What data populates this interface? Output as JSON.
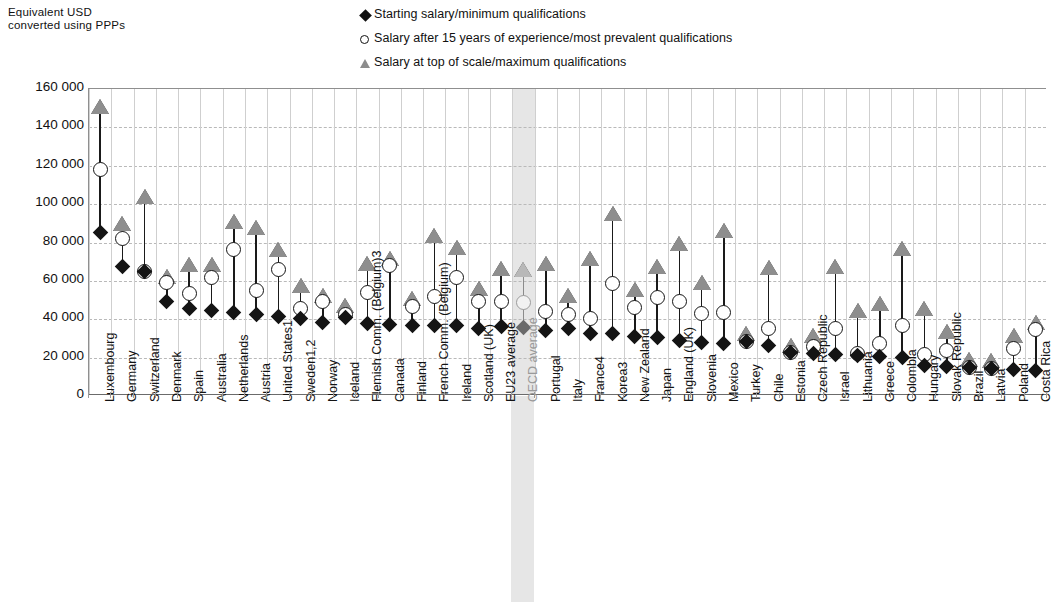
{
  "axis_caption": "Equivalent  USD\nconverted  using PPPs",
  "legend": [
    {
      "marker": "diamond-marker",
      "label": "Starting salary/minimum qualifications"
    },
    {
      "marker": "circle-marker",
      "label": "Salary after 15 years of experience/most prevalent qualifications"
    },
    {
      "marker": "triangle-marker",
      "label": "Salary at top of scale/maximum qualifications"
    }
  ],
  "colors": {
    "starting": "#141414",
    "after15": "#ffffff",
    "top_of_scale": "#8e8e8e",
    "highlight_band": "#e6e6e6",
    "grid": "#cfcfcf"
  },
  "highlight_category": "OECD average",
  "chart_data": {
    "type": "scatter",
    "title": "",
    "subtitle": "",
    "xlabel": "",
    "ylabel": "Equivalent USD converted using PPPs",
    "ylim": [
      0,
      160000
    ],
    "ytick_labels": [
      "160 000",
      "140 000",
      "120 000",
      "100 000",
      "80 000",
      "60 000",
      "40 000",
      "20 000",
      "0"
    ],
    "ytick_values": [
      160000,
      140000,
      120000,
      100000,
      80000,
      60000,
      40000,
      20000,
      0
    ],
    "grid": true,
    "legend_position": "top-center",
    "categories": [
      "Luxembourg",
      "Germany",
      "Switzerland",
      "Denmark",
      "Spain",
      "Australia",
      "Netherlands",
      "Austria",
      "United States1",
      "Sweden1,2",
      "Norway",
      "Iceland",
      "Flemish Comm. (Belgium)3",
      "Canada",
      "Finland",
      "French Comm. (Belgium)",
      "Ireland",
      "Scotland (UK)",
      "EU23 average",
      "OECD average",
      "Portugal",
      "Italy",
      "France4",
      "Korea3",
      "New Zealand",
      "Japan",
      "England (UK)",
      "Slovenia",
      "Mexico",
      "Turkey",
      "Chile",
      "Estonia",
      "Czech Republic",
      "Israel",
      "Lithuania",
      "Greece",
      "Colombia",
      "Hungary",
      "Slovak Republic",
      "Brazil",
      "Latvia",
      "Poland",
      "Costa Rica"
    ],
    "series": [
      {
        "name": "Starting salary/minimum qualifications",
        "values": [
          85000,
          67500,
          65000,
          49500,
          45500,
          44500,
          43500,
          42500,
          41500,
          40500,
          38500,
          41000,
          38000,
          37500,
          37000,
          36500,
          36500,
          35000,
          36000,
          35500,
          34000,
          35000,
          32500,
          32500,
          31000,
          30500,
          29000,
          28000,
          27500,
          28500,
          26500,
          22500,
          22000,
          21500,
          21000,
          20500,
          20000,
          16000,
          15500,
          15000,
          14500,
          14000,
          13500
        ]
      },
      {
        "name": "Salary after 15 years of experience/most prevalent qualifications",
        "values": [
          118000,
          82000,
          65000,
          59000,
          53500,
          62000,
          76500,
          55000,
          66000,
          45500,
          49000,
          42500,
          54000,
          68000,
          46500,
          52000,
          62000,
          49000,
          49000,
          48500,
          44000,
          42500,
          40500,
          58500,
          46000,
          51500,
          49500,
          43000,
          43500,
          28500,
          35000,
          22500,
          26000,
          35000,
          22000,
          27500,
          36500,
          21500,
          23500,
          15000,
          14500,
          24500,
          34500
        ]
      },
      {
        "name": "Salary at top of scale/maximum qualifications",
        "values": [
          147000,
          86000,
          100000,
          58500,
          64500,
          64500,
          87000,
          84000,
          72500,
          53500,
          48500,
          43500,
          65000,
          68000,
          47000,
          80000,
          73500,
          52000,
          62500,
          62000,
          65000,
          48500,
          67500,
          91000,
          51500,
          63500,
          75500,
          55500,
          82500,
          28500,
          63000,
          22500,
          27500,
          63500,
          40500,
          44500,
          73000,
          41500,
          29500,
          15000,
          14500,
          27500,
          34500
        ]
      }
    ]
  }
}
